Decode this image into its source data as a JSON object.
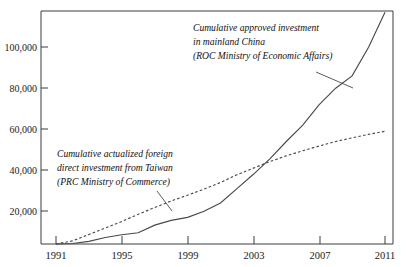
{
  "chart_data": {
    "type": "line",
    "title": "",
    "subtitle": "",
    "xlabel": "",
    "ylabel": "",
    "xlim": [
      1991,
      2011
    ],
    "ylim": [
      0,
      120000
    ],
    "grid": false,
    "legend_position": "inline-annotations",
    "x_ticks": [
      "1991",
      "1995",
      "1999",
      "2003",
      "2007",
      "2011"
    ],
    "x_tick_values": [
      1991,
      1995,
      1999,
      2003,
      2007,
      2011
    ],
    "y_ticks": [
      "20,000",
      "40,000",
      "60,000",
      "80,000",
      "100,000"
    ],
    "y_tick_values": [
      20000,
      40000,
      60000,
      80000,
      100000
    ],
    "x": [
      1991,
      1992,
      1993,
      1994,
      1995,
      1996,
      1997,
      1998,
      1999,
      2000,
      2001,
      2002,
      2003,
      2004,
      2005,
      2006,
      2007,
      2008,
      2009,
      2010,
      2011
    ],
    "series": [
      {
        "name": "Cumulative approved investment in mainland China (ROC Ministry of Economic Affairs)",
        "style": "solid",
        "values": [
          0,
          250,
          1300,
          3200,
          4500,
          5500,
          9200,
          11500,
          13000,
          16000,
          20000,
          27000,
          34000,
          41500,
          50000,
          58000,
          68000,
          76000,
          82000,
          96000,
          113000
        ]
      },
      {
        "name": "Cumulative actualized foreign direct investment from Taiwan (PRC Ministry of Commerce)",
        "style": "dashed",
        "values": [
          0,
          1500,
          4600,
          7800,
          11000,
          14500,
          17800,
          21000,
          23800,
          26800,
          30000,
          33800,
          37000,
          40200,
          43000,
          45500,
          47800,
          50000,
          51800,
          53500,
          55000
        ]
      }
    ],
    "annotations": [
      {
        "id": "annotation-approved-investment",
        "lines": [
          "Cumulative approved investment",
          "in mainland China",
          "(ROC Ministry of Economic Affairs)"
        ],
        "leader_from": [
          316,
          73
        ],
        "leader_to": [
          352,
          86
        ]
      },
      {
        "id": "annotation-actualized-fdi",
        "lines": [
          "Cumulative actualized foreign",
          "direct investment from Taiwan",
          "(PRC Ministry of Commerce)"
        ],
        "leader_from": [
          158,
          180
        ],
        "leader_to": [
          172,
          206
        ]
      }
    ],
    "colors": {
      "axis": "#3d3d3d",
      "series": "#4a4a4a",
      "text": "#111111",
      "background": "#ffffff"
    }
  }
}
